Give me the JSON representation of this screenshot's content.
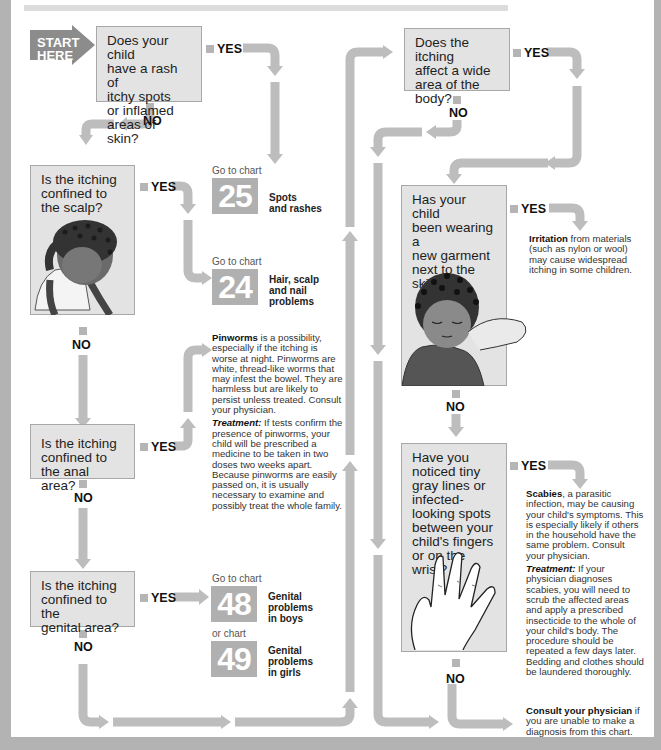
{
  "start": {
    "label_line1": "START",
    "label_line2": "HERE"
  },
  "questions": [
    {
      "id": "q1",
      "lines": [
        "Does your child",
        "have a rash of",
        "itchy spots",
        "or inflamed",
        "areas of skin?"
      ]
    },
    {
      "id": "q2",
      "lines": [
        "Is the itching",
        "confined to",
        "the scalp?"
      ]
    },
    {
      "id": "q3",
      "lines": [
        "Is the itching",
        "confined to",
        "the anal area?"
      ]
    },
    {
      "id": "q4",
      "lines": [
        "Is the itching",
        "confined to the",
        "genital area?"
      ]
    },
    {
      "id": "q5",
      "lines": [
        "Does the itching",
        "affect a wide",
        "area of the",
        "body?"
      ]
    },
    {
      "id": "q6",
      "lines": [
        "Has your child",
        "been wearing a",
        "new garment",
        "next to the",
        "skin?"
      ]
    },
    {
      "id": "q7",
      "lines": [
        "Have you",
        "noticed tiny",
        "gray lines or",
        "infected-",
        "looking spots",
        "between your",
        "child's fingers",
        "or on the wrist?"
      ]
    }
  ],
  "labels": {
    "yes": "YES",
    "no": "NO"
  },
  "chart_refs": [
    {
      "prefix": "Go to chart",
      "number": "25",
      "desc_lines": [
        "Spots",
        "and rashes"
      ]
    },
    {
      "prefix": "Go to chart",
      "number": "24",
      "desc_lines": [
        "Hair, scalp",
        "and nail",
        "problems"
      ]
    },
    {
      "prefix": "Go to chart",
      "number": "48",
      "desc_lines": [
        "Genital",
        "problems",
        "in boys"
      ]
    },
    {
      "prefix": "or chart",
      "number": "49",
      "desc_lines": [
        "Genital",
        "problems",
        "in girls"
      ]
    }
  ],
  "outcomes": {
    "pinworms": {
      "title": "Pinworms",
      "text": " is a possibility, especially if the itching is worse at night. Pinworms are white, thread-like worms that may infest the bowel. They are harmless but are likely to persist unless treated. Consult your physician.",
      "treatment_title": "Treatment:",
      "treatment_text": " If tests confirm the presence of pinworms, your child will be prescribed a medicine to be taken in two doses two weeks apart. Because pinworms are easily passed on, it is usually necessary to examine and possibly treat the whole family."
    },
    "irritation": {
      "title": "Irritation",
      "text": " from materials (such as nylon or wool) may cause widespread itching in some children."
    },
    "scabies": {
      "title": "Scabies",
      "text": ", a parasitic infection, may be causing your child's symptoms. This is especially likely if others in the household have the same problem. Consult your physician.",
      "treatment_title": "Treatment:",
      "treatment_text": " If your physician diagnoses scabies, you will need to scrub the affected areas and apply a prescribed insecticide to the whole of your child's body. The procedure should be repeated a few days later. Bedding and clothes should be laundered thoroughly."
    },
    "consult": {
      "title": "Consult your physician",
      "text": " if you are unable to make a diagnosis from this chart."
    }
  },
  "colors": {
    "arrow": "#bdbdbd",
    "box_fill": "#e3e3e3",
    "chart_tile": "#b0b0b0",
    "frame": "#b3b3b3"
  }
}
